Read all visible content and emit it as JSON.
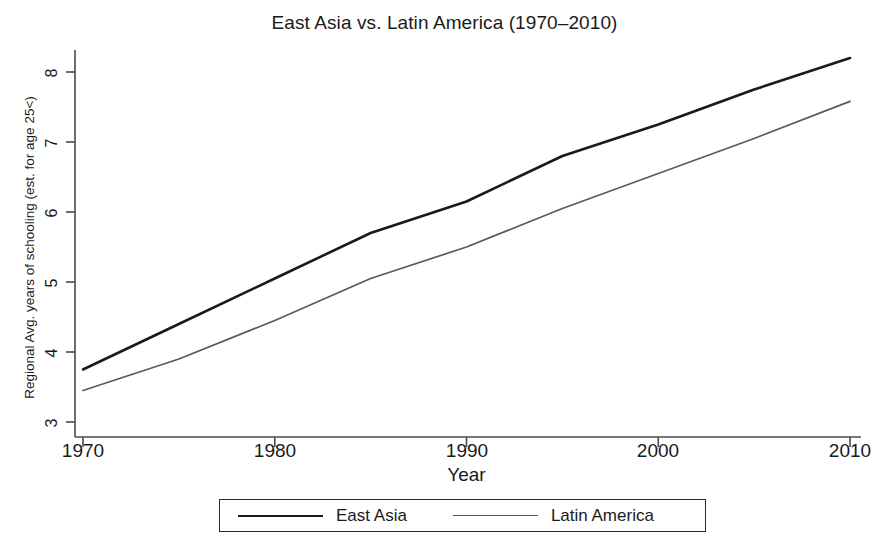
{
  "chart_data": {
    "type": "line",
    "title": "East Asia vs. Latin America (1970–2010)",
    "xlabel": "Year",
    "ylabel": "Regional Avg. years of schooling (est. for age 25<)",
    "x": [
      1970,
      1975,
      1980,
      1985,
      1990,
      1995,
      2000,
      2005,
      2010
    ],
    "xlim": [
      1970,
      2010
    ],
    "ylim": [
      3,
      8.3
    ],
    "xticks": [
      1970,
      1980,
      1990,
      2000,
      2010
    ],
    "yticks": [
      3,
      4,
      5,
      6,
      7,
      8
    ],
    "grid": false,
    "legend_position": "bottom",
    "series": [
      {
        "name": "East Asia",
        "color": "#1a1a1a",
        "line_width": 2.6,
        "values": [
          3.75,
          4.4,
          5.05,
          5.7,
          6.15,
          6.8,
          7.25,
          7.75,
          8.2
        ]
      },
      {
        "name": "Latin America",
        "color": "#5a5a5a",
        "line_width": 1.7,
        "values": [
          3.45,
          3.9,
          4.45,
          5.05,
          5.5,
          6.05,
          6.55,
          7.05,
          7.58
        ]
      }
    ]
  },
  "axis": {
    "ytick_labels": [
      "3",
      "4",
      "5",
      "6",
      "7",
      "8"
    ],
    "xtick_labels": [
      "1970",
      "1980",
      "1990",
      "2000",
      "2010"
    ]
  },
  "legend": {
    "items": [
      {
        "label": "East Asia"
      },
      {
        "label": "Latin America"
      }
    ]
  }
}
